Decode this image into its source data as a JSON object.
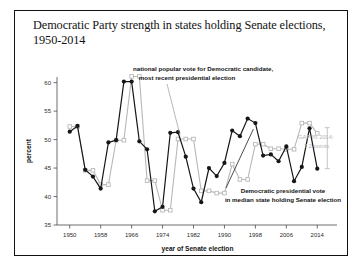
{
  "figure": {
    "title": "Democratic Party strength in states holding Senate elections, 1950-2014",
    "title_line1": "Democratic Party strength in states holding Senate",
    "title_line2": "elections, 1950-2014"
  },
  "annotations": {
    "national_line1": "national popular vote for Democratic candidate,",
    "national_line2": "most recent presidential election",
    "median_line1": "Democratic presidential vote",
    "median_line2": "in median state holding Senate election",
    "gap_line1": "GAP IN 2014:",
    "gap_line2": "7.2 points"
  },
  "colors": {
    "median_series": "#161616",
    "national_series": "#b8b8b8",
    "frame": "#15110f",
    "axis": "#4a4a4a",
    "gap_bracket": "#bdbdbd"
  },
  "chart_data": {
    "type": "line",
    "title": "Democratic Party strength in states holding Senate elections, 1950-2014",
    "xlabel": "year of Senate election",
    "ylabel": "percent",
    "xlim": [
      1948,
      2016
    ],
    "ylim": [
      35,
      61
    ],
    "xticks": [
      1950,
      1958,
      1966,
      1974,
      1982,
      1990,
      1998,
      2006,
      2014
    ],
    "xtick_labels": [
      "1950",
      "1958",
      "1966",
      "1974",
      "1982",
      "1990",
      "1998",
      "2006",
      "2014"
    ],
    "yticks": [
      35,
      40,
      45,
      50,
      55,
      60
    ],
    "ytick_labels": [
      "35",
      "40",
      "45",
      "50",
      "55",
      "60"
    ],
    "grid": false,
    "legend": "annotated-inline",
    "x": [
      1950,
      1952,
      1954,
      1956,
      1958,
      1960,
      1962,
      1964,
      1966,
      1968,
      1970,
      1972,
      1974,
      1976,
      1978,
      1980,
      1982,
      1984,
      1986,
      1988,
      1990,
      1992,
      1994,
      1996,
      1998,
      2000,
      2002,
      2004,
      2006,
      2008,
      2010,
      2012,
      2014
    ],
    "series": [
      {
        "name": "Democratic presidential vote in median state holding Senate election",
        "color": "#161616",
        "marker": "filled-circle",
        "values": [
          51.4,
          52.4,
          44.7,
          43.5,
          41.4,
          49.5,
          49.9,
          60.2,
          60.2,
          49.7,
          48.3,
          37.4,
          38.2,
          51.2,
          51.3,
          47.0,
          41.4,
          39.0,
          45.0,
          43.6,
          45.9,
          51.6,
          50.6,
          53.7,
          52.9,
          47.2,
          47.4,
          46.2,
          48.8,
          42.7,
          45.2,
          52.0,
          44.9
        ]
      },
      {
        "name": "national popular vote for Democratic candidate, most recent presidential election",
        "color": "#b8b8b8",
        "marker": "open-square",
        "values": [
          52.3,
          52.3,
          44.6,
          44.6,
          42.1,
          42.1,
          49.9,
          49.9,
          61.1,
          61.1,
          42.8,
          42.8,
          37.6,
          37.6,
          50.1,
          50.1,
          50.1,
          41.0,
          41.0,
          40.6,
          40.6,
          45.7,
          43.0,
          43.0,
          49.2,
          49.2,
          48.4,
          48.4,
          48.3,
          48.3,
          52.9,
          52.9,
          51.1
        ]
      }
    ],
    "gap_2014": {
      "label": "GAP IN 2014: 7.2 points",
      "value": 7.2,
      "year": 2014,
      "upper": 52.1,
      "lower": 44.9
    }
  }
}
